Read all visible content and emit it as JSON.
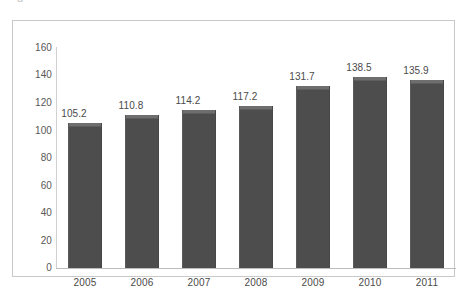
{
  "figure": {
    "caption_stub": "g",
    "frame_color": "#c9c9c9",
    "background": "#ffffff"
  },
  "chart_data": {
    "type": "bar",
    "title": "",
    "subtitle": "",
    "xlabel": "",
    "ylabel": "",
    "categories": [
      "2005",
      "2006",
      "2007",
      "2008",
      "2009",
      "2010",
      "2011"
    ],
    "values": [
      105.2,
      110.8,
      114.2,
      117.2,
      131.7,
      138.5,
      135.9
    ],
    "data_labels": [
      "105.2",
      "110.8",
      "114.2",
      "117.2",
      "131.7",
      "138.5",
      "135.9"
    ],
    "ylim": [
      0,
      160
    ],
    "yticks": [
      160,
      140,
      120,
      100,
      80,
      60,
      40,
      20,
      0
    ],
    "ytick_labels": [
      "160",
      "140",
      "120",
      "100",
      "80",
      "60",
      "40",
      "20",
      "0"
    ],
    "grid": false,
    "legend": null,
    "legend_position": "none",
    "series": [
      {
        "name": "",
        "values": [
          105.2,
          110.8,
          114.2,
          117.2,
          131.7,
          138.5,
          135.9
        ],
        "color": "#4d4d4d",
        "top_highlight_color": "#6e6e6e"
      }
    ],
    "axis_color": "#c9c9c9",
    "label_color": "#4a4a4a"
  }
}
